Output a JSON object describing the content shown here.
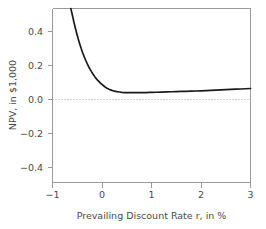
{
  "chart_data": {
    "type": "line",
    "title": "",
    "xlabel": "Prevailing Discount Rate r, in %",
    "ylabel": "NPV, in $1,000",
    "xlim": [
      -1,
      3
    ],
    "ylim": [
      -0.56,
      0.56
    ],
    "xticks": [
      -1,
      0,
      1,
      2,
      3
    ],
    "xticklabels": [
      "−1",
      "0",
      "1",
      "2",
      "3"
    ],
    "yticks": [
      0.4,
      0.2,
      0.0,
      -0.2,
      -0.4
    ],
    "yticklabels": [
      "0.4",
      "0.2",
      "0.0",
      "−0.2",
      "−0.4"
    ],
    "grid": false,
    "legend": null,
    "annotations": [
      {
        "name": "zero-reference-line",
        "type": "hline",
        "y": 0.0,
        "style": "dotted",
        "color": "#9a9a9a"
      }
    ],
    "series": [
      {
        "name": "NPV curve",
        "color": "#1a1a1a",
        "x": [
          -0.63,
          -0.6,
          -0.57,
          -0.54,
          -0.51,
          -0.48,
          -0.45,
          -0.42,
          -0.39,
          -0.36,
          -0.33,
          -0.3,
          -0.27,
          -0.24,
          -0.21,
          -0.18,
          -0.15,
          -0.12,
          -0.09,
          -0.06,
          -0.03,
          0.0,
          0.05,
          0.1,
          0.15,
          0.2,
          0.25,
          0.3,
          0.4,
          0.5,
          0.6,
          0.7,
          0.8,
          0.9,
          1.0,
          1.2,
          1.4,
          1.6,
          1.8,
          2.0,
          2.2,
          2.4,
          2.6,
          2.8,
          3.0
        ],
        "y": [
          0.56,
          0.52,
          0.476,
          0.436,
          0.399,
          0.364,
          0.332,
          0.302,
          0.275,
          0.25,
          0.227,
          0.206,
          0.186,
          0.168,
          0.152,
          0.137,
          0.123,
          0.11,
          0.099,
          0.089,
          0.079,
          0.071,
          0.058,
          0.047,
          0.039,
          0.033,
          0.028,
          0.025,
          0.02,
          0.018,
          0.018,
          0.018,
          0.019,
          0.019,
          0.02,
          0.022,
          0.024,
          0.026,
          0.028,
          0.03,
          0.033,
          0.036,
          0.039,
          0.042,
          0.045
        ]
      }
    ]
  },
  "axes": {
    "x_title": "Prevailing Discount Rate r, in %",
    "y_title": "NPV, in $1,000",
    "x_tick_labels": [
      "−1",
      "0",
      "1",
      "2",
      "3"
    ],
    "y_tick_labels": [
      "0.4",
      "0.2",
      "0.0",
      "−0.2",
      "−0.4"
    ]
  },
  "colors": {
    "curve": "#1a1a1a",
    "axis": "#9a9a9a",
    "text": "#4a4a4a",
    "background": "#ffffff"
  }
}
